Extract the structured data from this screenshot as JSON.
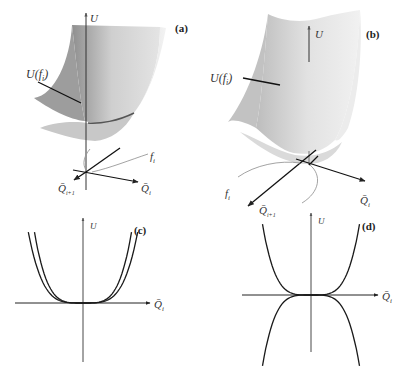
{
  "figure": {
    "panels": [
      {
        "id": "a",
        "tag": "(a)",
        "kind": "3d-surface",
        "axis_labels": {
          "vertical": "U",
          "right": "Q̄",
          "right_sub": "i",
          "left": "Q̄",
          "left_sub": "i+1"
        },
        "surface_label": "U(f",
        "surface_label_sub": "i",
        "surface_label_close": ")",
        "curve_label": "f",
        "curve_label_sub": "i",
        "description": "Stable: valley-shaped surface, minimum at origin"
      },
      {
        "id": "b",
        "tag": "(b)",
        "kind": "3d-surface",
        "axis_labels": {
          "vertical": "U",
          "right": "Q̄",
          "right_sub": "i",
          "left": "Q̄",
          "left_sub": "i+1"
        },
        "surface_label": "U(f",
        "surface_label_sub": "i",
        "surface_label_close": ")",
        "curve_label": "f",
        "curve_label_sub": "i",
        "description": "Surface curving up along one direction"
      },
      {
        "id": "c",
        "tag": "(c)",
        "kind": "2d-section",
        "axis_labels": {
          "vertical": "U",
          "horizontal": "Q̄",
          "horizontal_sub": "i"
        }
      },
      {
        "id": "d",
        "tag": "(d)",
        "kind": "2d-section",
        "axis_labels": {
          "vertical": "U",
          "horizontal": "Q̄",
          "horizontal_sub": "i"
        }
      }
    ]
  },
  "chart_data": [
    {
      "type": "line",
      "panel": "c",
      "title": "(c)",
      "xlabel": "Q̄_i",
      "ylabel": "U",
      "xlim": [
        -1,
        1
      ],
      "ylim": [
        -1,
        1
      ],
      "series": [
        {
          "name": "inner",
          "form": "a*x^4",
          "coef": 1.0
        },
        {
          "name": "outer",
          "form": "a*x^4",
          "coef": 0.62
        }
      ]
    },
    {
      "type": "line",
      "panel": "d",
      "title": "(d)",
      "xlabel": "Q̄_i",
      "ylabel": "U",
      "xlim": [
        -1,
        1
      ],
      "ylim": [
        -1,
        1
      ],
      "series": [
        {
          "name": "upper",
          "form": "a*x^4",
          "coef": 1.0
        },
        {
          "name": "lower",
          "form": "a*x^4",
          "coef": -1.0
        }
      ]
    }
  ]
}
